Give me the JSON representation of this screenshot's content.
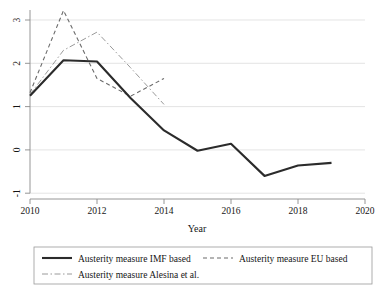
{
  "chart_data": {
    "type": "line",
    "title": "",
    "xlabel": "Year",
    "ylabel": "",
    "xlim": [
      2010,
      2020
    ],
    "ylim": [
      -1,
      3.3
    ],
    "grid": true,
    "legend_position": "bottom",
    "x_ticks": [
      "2010",
      "2012",
      "2014",
      "2016",
      "2018",
      "2020"
    ],
    "x_tick_values": [
      2010,
      2012,
      2014,
      2016,
      2018,
      2020
    ],
    "y_ticks": [
      "3",
      "2",
      "1",
      "0",
      "-1"
    ],
    "y_tick_values": [
      3,
      2,
      1,
      0,
      -1
    ],
    "series": [
      {
        "name": "Austerity measure IMF based",
        "style": "solid",
        "color": "#2b2b2b",
        "x": [
          2010,
          2011,
          2012,
          2013,
          2014,
          2015,
          2016,
          2017,
          2018,
          2019
        ],
        "values": [
          1.25,
          2.07,
          2.04,
          1.2,
          0.45,
          -0.02,
          0.14,
          -0.6,
          -0.36,
          -0.3
        ]
      },
      {
        "name": "Austerity measure EU based",
        "style": "dashed",
        "color": "#6b6b6b",
        "x": [
          2010,
          2011,
          2012,
          2013,
          2014
        ],
        "values": [
          1.32,
          3.22,
          1.65,
          1.24,
          1.65
        ]
      },
      {
        "name": "Austerity measure Alesina et al.",
        "style": "dash-dot",
        "color": "#9a9a9a",
        "x": [
          2010,
          2011,
          2012,
          2013,
          2014
        ],
        "values": [
          1.28,
          2.3,
          2.72,
          1.9,
          1.05
        ]
      }
    ]
  },
  "legend": {
    "items": [
      {
        "label": "Austerity measure IMF based",
        "style": "solid"
      },
      {
        "label": "Austerity measure EU based",
        "style": "dashed"
      },
      {
        "label": "Austerity measure Alesina et al.",
        "style": "dash-dot"
      }
    ]
  },
  "axes": {
    "x_title": "Year"
  }
}
